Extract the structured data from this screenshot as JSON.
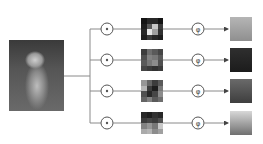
{
  "diagram": {
    "input": {
      "label": "input-image",
      "subject": "puppy"
    },
    "branches": [
      {
        "op_symbol": "⊙",
        "func_symbol": "φ",
        "heatmap": [
          [
            20,
            40,
            40,
            20
          ],
          [
            30,
            90,
            200,
            60
          ],
          [
            40,
            230,
            160,
            50
          ],
          [
            30,
            60,
            40,
            30
          ]
        ],
        "output_tone": "light"
      },
      {
        "op_symbol": "⊙",
        "func_symbol": "φ",
        "heatmap": [
          [
            60,
            110,
            90,
            70
          ],
          [
            80,
            130,
            120,
            90
          ],
          [
            90,
            120,
            140,
            80
          ],
          [
            70,
            60,
            50,
            60
          ]
        ],
        "output_tone": "dark"
      },
      {
        "op_symbol": "⊙",
        "func_symbol": "φ",
        "heatmap": [
          [
            150,
            100,
            60,
            90
          ],
          [
            180,
            60,
            30,
            120
          ],
          [
            80,
            40,
            70,
            140
          ],
          [
            100,
            130,
            90,
            110
          ]
        ],
        "output_tone": "medium"
      },
      {
        "op_symbol": "⊙",
        "func_symbol": "φ",
        "heatmap": [
          [
            40,
            30,
            50,
            40
          ],
          [
            60,
            70,
            60,
            80
          ],
          [
            130,
            150,
            120,
            200
          ],
          [
            170,
            180,
            140,
            160
          ]
        ],
        "output_tone": "bright"
      }
    ],
    "colors": {
      "line": "#8a8a8a",
      "circle": "#555555",
      "arrow": "#444444"
    }
  }
}
